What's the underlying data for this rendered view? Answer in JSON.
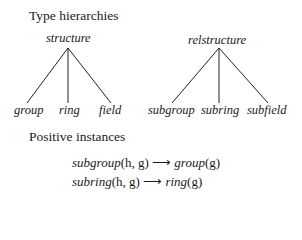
{
  "sections": {
    "hierarchies_title": "Type hierarchies",
    "instances_title": "Positive instances"
  },
  "trees": [
    {
      "root": "structure",
      "children": [
        "group",
        "ring",
        "field"
      ]
    },
    {
      "root": "relstructure",
      "children": [
        "subgroup",
        "subring",
        "subfield"
      ]
    }
  ],
  "instances": [
    {
      "lhs": "subgroup",
      "lhs_args": "(h, g)",
      "arrow": "⟶",
      "rhs": "group",
      "rhs_args": "(g)"
    },
    {
      "lhs": "subring",
      "lhs_args": "(h, g)",
      "arrow": "⟶",
      "rhs": "ring",
      "rhs_args": "(g)"
    }
  ]
}
